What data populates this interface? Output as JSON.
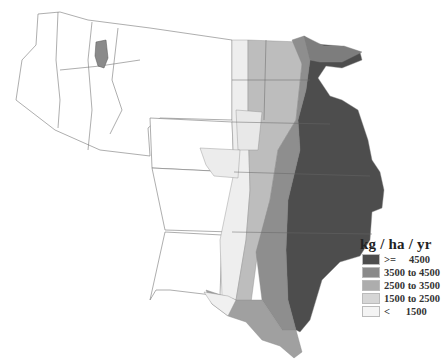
{
  "legend": {
    "title": "kg / ha / yr",
    "items": [
      {
        "label": ">=     4500",
        "color": "#4d4d4d"
      },
      {
        "label": "3500 to 4500",
        "color": "#8a8a8a"
      },
      {
        "label": "2500 to 3500",
        "color": "#adadad"
      },
      {
        "label": "1500 to 2500",
        "color": "#d6d6d6"
      },
      {
        "label": "<      1500",
        "color": "#f4f4f4"
      }
    ]
  },
  "map": {
    "description": "Choropleth map of the western and central United States showing values in kg/ha/yr; highest classes concentrated along the eastern edge (Minnesota through east Texas), grading to lowest in the west.",
    "highlight_region": "small patch in northern Idaho at 3500 to 4500 class"
  }
}
